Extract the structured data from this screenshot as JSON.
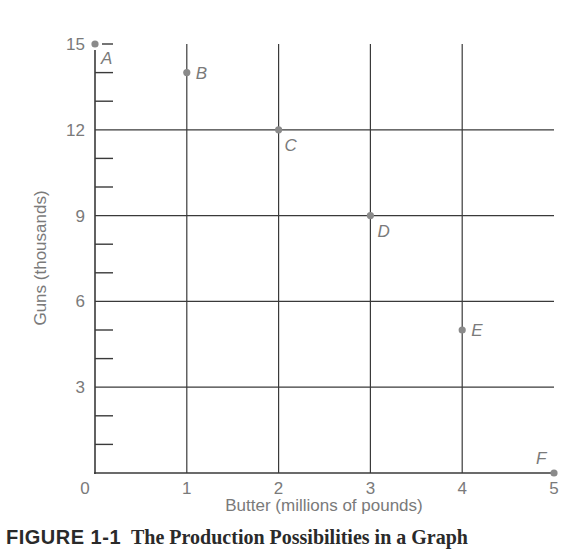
{
  "chart_data": {
    "type": "scatter",
    "title": "",
    "xlabel": "Butter (millions of pounds)",
    "ylabel": "Guns (thousands)",
    "xlim": [
      0,
      5
    ],
    "ylim": [
      0,
      15
    ],
    "x_ticks": [
      "0",
      "1",
      "2",
      "3",
      "4",
      "5"
    ],
    "y_ticks": [
      "3",
      "6",
      "9",
      "12",
      "15"
    ],
    "y_minor_tick_step": 1,
    "grid": true,
    "points": [
      {
        "label": "A",
        "x": 0,
        "y": 15
      },
      {
        "label": "B",
        "x": 1,
        "y": 14
      },
      {
        "label": "C",
        "x": 2,
        "y": 12
      },
      {
        "label": "D",
        "x": 3,
        "y": 9
      },
      {
        "label": "E",
        "x": 4,
        "y": 5
      },
      {
        "label": "F",
        "x": 5,
        "y": 0
      }
    ],
    "colors": {
      "grid": "#3a3a3a",
      "point": "#8a8a8a",
      "text": "#7a7a7a"
    }
  },
  "caption": {
    "figure_number": "FIGURE 1-1",
    "title": "The Production Possibilities in a Graph"
  }
}
